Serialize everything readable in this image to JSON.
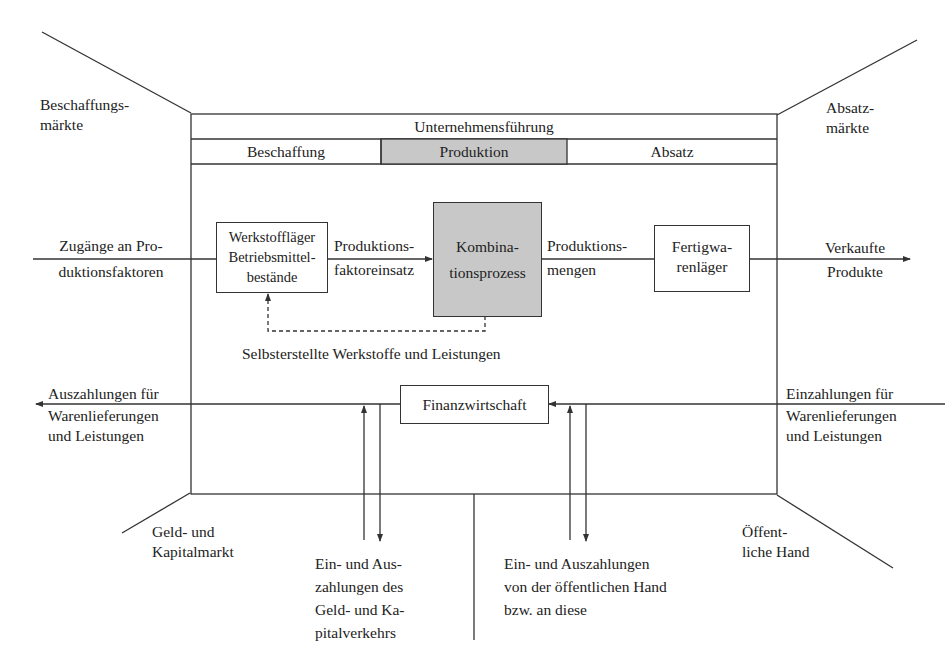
{
  "corners": {
    "top_left": [
      "Beschaffungs-",
      "märkte"
    ],
    "top_right": [
      "Absatz-",
      "märkte"
    ],
    "bottom_left": [
      "Geld- und",
      "Kapitalmarkt"
    ],
    "bottom_right": [
      "Öffent-",
      "liche Hand"
    ]
  },
  "header": {
    "management": "Unternehmensführung",
    "functions": [
      {
        "label": "Beschaffung",
        "highlighted": false
      },
      {
        "label": "Produktion",
        "highlighted": true
      },
      {
        "label": "Absatz",
        "highlighted": false
      }
    ]
  },
  "production_flow": {
    "input_label": [
      "Zugänge an Pro-",
      "duktionsfaktoren"
    ],
    "stock_box": [
      "Werkstoffläger",
      "Betriebsmittel-",
      "bestände"
    ],
    "factor_input_label": [
      "Produktions-",
      "faktoreinsatz"
    ],
    "process_box": [
      "Kombina-",
      "tionsprozess"
    ],
    "output_quantity_label": [
      "Produktions-",
      "mengen"
    ],
    "finished_goods_box": [
      "Fertigwa-",
      "renläger"
    ],
    "sold_label": [
      "Verkaufte",
      "Produkte"
    ],
    "feedback_label": "Selbsterstellte Werkstoffe und Leistungen"
  },
  "finance_flow": {
    "finance_box": "Finanzwirtschaft",
    "outgoing_label": [
      "Auszahlungen für",
      "Warenlieferungen",
      "und Leistungen"
    ],
    "incoming_label": [
      "Einzahlungen für",
      "Warenlieferungen",
      "und Leistungen"
    ],
    "capital_label": [
      "Ein- und Aus-",
      "zahlungen des",
      "Geld- und Ka-",
      "pitalverkehrs"
    ],
    "public_label": [
      "Ein- und Auszahlungen",
      "von der öffentlichen Hand",
      "bzw. an diese"
    ]
  }
}
